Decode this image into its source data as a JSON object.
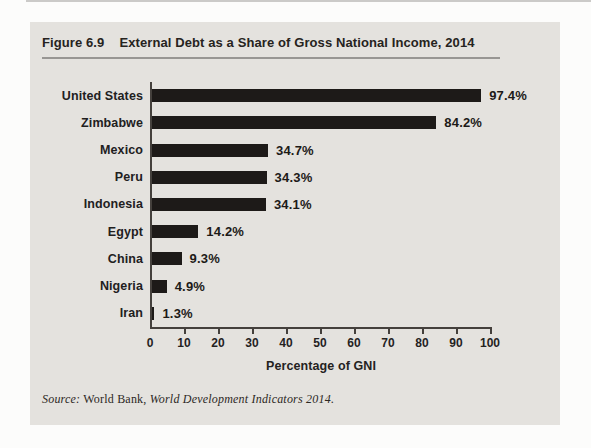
{
  "figure": {
    "label": "Figure 6.9",
    "title": "External Debt as a Share of Gross National Income, 2014"
  },
  "chart_data": {
    "type": "bar",
    "orientation": "horizontal",
    "title": "External Debt as a Share of Gross National Income, 2014",
    "categories": [
      "United States",
      "Zimbabwe",
      "Mexico",
      "Peru",
      "Indonesia",
      "Egypt",
      "China",
      "Nigeria",
      "Iran"
    ],
    "values": [
      97.4,
      84.2,
      34.7,
      34.3,
      34.1,
      14.2,
      9.3,
      4.9,
      1.3
    ],
    "value_labels": [
      "97.4%",
      "84.2%",
      "34.7%",
      "34.3%",
      "34.1%",
      "14.2%",
      "9.3%",
      "4.9%",
      "1.3%"
    ],
    "xlabel": "Percentage of GNI",
    "ylabel": "",
    "xlim": [
      0,
      100
    ],
    "xticks": [
      0,
      10,
      20,
      30,
      40,
      50,
      60,
      70,
      80,
      90,
      100
    ],
    "grid": false,
    "legend": null,
    "bar_color": "#1d1a18"
  },
  "source": {
    "prefix": "Source:",
    "roman": " World Bank, ",
    "italic": "World Development Indicators 2014",
    "suffix": "."
  },
  "colors": {
    "panel_bg": "#e4e2de",
    "bar": "#1d1a18",
    "axis": "#44403c",
    "title_rule": "#989693",
    "text": "#24221f"
  }
}
